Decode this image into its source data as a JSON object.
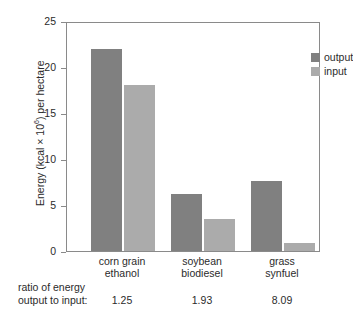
{
  "chart_data": {
    "type": "bar",
    "title": "",
    "subtitle": "",
    "xlabel": "",
    "ylabel": "Energy (kcal × 10⁶) per hectare",
    "ylabel_parts": {
      "prefix": "Energy (kcal × 10",
      "exponent": "6",
      "suffix": ") per hectare"
    },
    "ylim": [
      0,
      25
    ],
    "yticks": [
      0,
      5,
      10,
      15,
      20,
      25
    ],
    "ytick_labels": [
      "0",
      "5",
      "10",
      "15",
      "20",
      "25"
    ],
    "grid": false,
    "legend_position": "top-right",
    "categories": [
      "corn grain ethanol",
      "soybean biodiesel",
      "grass synfuel"
    ],
    "category_label_lines": [
      [
        "corn grain",
        "ethanol"
      ],
      [
        "soybean",
        "biodiesel"
      ],
      [
        "grass",
        "synfuel"
      ]
    ],
    "series": [
      {
        "name": "output",
        "color": "#808080",
        "values": [
          22.0,
          6.2,
          7.6
        ]
      },
      {
        "name": "input",
        "color": "#ababab",
        "values": [
          18.0,
          3.5,
          0.9
        ]
      }
    ],
    "annotations": {
      "ratio_caption_line1": "ratio of energy",
      "ratio_caption_line2": "output to input:",
      "ratio_values": [
        "1.25",
        "1.93",
        "8.09"
      ]
    }
  },
  "legend": {
    "items": [
      {
        "label": "output",
        "color": "#808080"
      },
      {
        "label": "input",
        "color": "#ababab"
      }
    ]
  },
  "colors": {
    "output": "#808080",
    "input": "#ababab",
    "axis": "#8a8a8a",
    "text": "#2b2b2b",
    "background": "#ffffff"
  }
}
